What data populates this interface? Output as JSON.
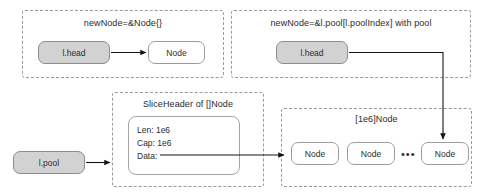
{
  "diagram": {
    "background": "#ffffff",
    "line_color": "#1a1a1a",
    "dashed_border_color": "#9a9a9a",
    "gray_fill": "#d2d2d2",
    "panels": [
      {
        "id": "new-node-literal",
        "title": "newNode=&Node{}",
        "nodes": [
          {
            "id": "l-head-1",
            "label": "l.head",
            "style": "gray"
          },
          {
            "id": "node-1",
            "label": "Node",
            "style": "white"
          }
        ]
      },
      {
        "id": "new-node-pool",
        "title": "newNode=&l.pool[l.poolIndex] with pool",
        "nodes": [
          {
            "id": "l-head-2",
            "label": "l.head",
            "style": "gray"
          }
        ]
      },
      {
        "id": "slice-header",
        "title": "SliceHeader of []Node",
        "fields": [
          {
            "id": "len",
            "label": "Len: 1e6"
          },
          {
            "id": "cap",
            "label": "Cap: 1e6"
          },
          {
            "id": "data",
            "label": "Data:"
          }
        ]
      },
      {
        "id": "node-array",
        "title": "[1e6]Node",
        "nodes": [
          {
            "id": "arr-node-1",
            "label": "Node",
            "style": "white"
          },
          {
            "id": "arr-node-2",
            "label": "Node",
            "style": "white"
          },
          {
            "id": "arr-node-3",
            "label": "Node",
            "style": "white"
          }
        ],
        "ellipsis": "•••"
      }
    ],
    "standalone_nodes": [
      {
        "id": "l-pool",
        "label": "l.pool",
        "style": "gray"
      }
    ]
  }
}
